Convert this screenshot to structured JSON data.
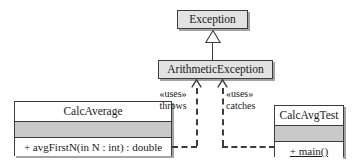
{
  "diagram": {
    "type": "uml-class-diagram",
    "background_color": "#ffffff",
    "line_color": "#3c3c3c",
    "fill_gray": "#c9c9c9",
    "header_gray": "#e2e2e2"
  },
  "classes": {
    "exception": {
      "name": "Exception"
    },
    "arithmetic_exception": {
      "name": "ArithmeticException"
    },
    "calc_average": {
      "name": "CalcAverage",
      "attributes": "",
      "operation": "+ avgFirstN(in N : int) : double"
    },
    "calc_avg_test": {
      "name": "CalcAvgTest",
      "attributes": "",
      "operation": "+ main()"
    }
  },
  "relationships": {
    "generalization": {
      "from": "ArithmeticException",
      "to": "Exception",
      "kind": "inheritance"
    },
    "throws": {
      "stereotype": "«uses»",
      "label": "throws",
      "from": "CalcAverage",
      "to": "ArithmeticException",
      "kind": "dependency"
    },
    "catches": {
      "stereotype": "«uses»",
      "label": "catches",
      "from": "CalcAvgTest",
      "to": "ArithmeticException",
      "kind": "dependency"
    }
  }
}
